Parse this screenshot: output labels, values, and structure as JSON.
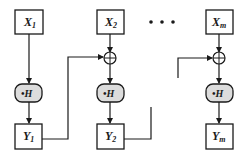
{
  "diagram": {
    "inputs": [
      {
        "var": "X",
        "sub": "1"
      },
      {
        "var": "X",
        "sub": "2"
      },
      {
        "var": "X",
        "sub": "m"
      }
    ],
    "nodes": [
      {
        "label": "•H"
      },
      {
        "label": "•H"
      },
      {
        "label": "•H"
      }
    ],
    "outputs": [
      {
        "var": "Y",
        "sub": "1"
      },
      {
        "var": "Y",
        "sub": "2"
      },
      {
        "var": "Y",
        "sub": "m"
      }
    ],
    "ellipsis": "• • •",
    "combiner_symbol": "⊕",
    "colors": {
      "stroke": "#1a1a1a",
      "node_fill": "#dcdcdc",
      "box_fill": "#ffffff"
    }
  }
}
